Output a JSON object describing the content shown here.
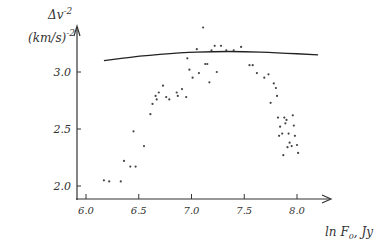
{
  "chart_data": {
    "type": "scatter",
    "title": "",
    "xlabel": "ln F0, Jy",
    "ylabel": "Δv^-2 (km/s)^-2",
    "ylabel_line1": "Δv",
    "ylabel_line1_sup": "-2",
    "ylabel_line2": "(km/s)",
    "ylabel_line2_sup": "-2",
    "xlabel_parts": {
      "main": "ln F",
      "sub": "0",
      "unit": ", Jy"
    },
    "xlim": [
      5.9,
      8.35
    ],
    "ylim": [
      1.9,
      3.55
    ],
    "grid": false,
    "legend": "none",
    "x_ticks": [
      {
        "value": 6.0,
        "label": "6.0"
      },
      {
        "value": 6.5,
        "label": "6.5"
      },
      {
        "value": 7.0,
        "label": "7.0"
      },
      {
        "value": 7.5,
        "label": "7.5"
      },
      {
        "value": 8.0,
        "label": "8.0"
      }
    ],
    "y_ticks": [
      {
        "value": 2.0,
        "label": "2.0"
      },
      {
        "value": 2.5,
        "label": "2.5"
      },
      {
        "value": 3.0,
        "label": "3.0"
      }
    ],
    "curve": {
      "name": "upper envelope",
      "x": [
        6.17,
        6.5,
        6.9,
        7.2,
        7.5,
        7.8,
        8.2
      ],
      "y": [
        3.1,
        3.14,
        3.17,
        3.18,
        3.18,
        3.17,
        3.15
      ]
    },
    "series": [
      {
        "name": "observations",
        "x": [
          6.17,
          6.22,
          6.33,
          6.36,
          6.42,
          6.45,
          6.47,
          6.55,
          6.61,
          6.63,
          6.66,
          6.67,
          6.69,
          6.73,
          6.76,
          6.79,
          6.86,
          6.87,
          6.91,
          6.95,
          6.96,
          6.98,
          7.01,
          7.05,
          7.07,
          7.11,
          7.13,
          7.15,
          7.17,
          7.19,
          7.22,
          7.24,
          7.28,
          7.33,
          7.4,
          7.47,
          7.55,
          7.58,
          7.62,
          7.69,
          7.73,
          7.75,
          7.78,
          7.8,
          7.81,
          7.82,
          7.84,
          7.86,
          7.88,
          7.89,
          7.9,
          7.92,
          7.93,
          7.95,
          7.96,
          7.98,
          8.0,
          8.01,
          7.83,
          7.87,
          7.91,
          7.97
        ],
        "y": [
          2.05,
          2.04,
          2.04,
          2.22,
          2.17,
          2.48,
          2.17,
          2.35,
          2.63,
          2.72,
          2.79,
          2.76,
          2.82,
          2.88,
          2.78,
          2.76,
          2.82,
          2.79,
          2.85,
          2.78,
          3.12,
          3.02,
          2.95,
          3.2,
          2.99,
          3.39,
          3.07,
          3.07,
          2.91,
          3.19,
          3.23,
          3.0,
          3.23,
          3.19,
          3.19,
          3.22,
          3.06,
          3.06,
          2.99,
          2.95,
          2.98,
          2.73,
          2.9,
          2.86,
          2.79,
          2.6,
          2.52,
          2.46,
          2.6,
          2.55,
          2.58,
          2.46,
          2.38,
          2.35,
          2.62,
          2.44,
          2.36,
          2.29,
          2.44,
          2.27,
          2.34,
          2.53
        ]
      }
    ]
  }
}
